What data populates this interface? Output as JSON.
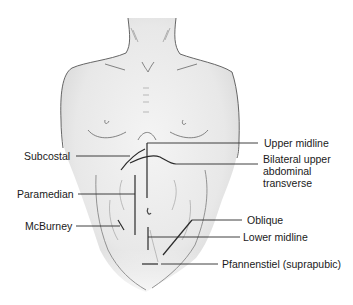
{
  "figure": {
    "labels": {
      "upper_midline": "Upper midline",
      "subcostal": "Subcostal",
      "bilateral_line1": "Bilateral upper",
      "bilateral_line2": "abdominal",
      "bilateral_line3": "transverse",
      "paramedian": "Paramedian",
      "mcburney": "McBurney",
      "oblique": "Oblique",
      "lower_midline": "Lower midline",
      "pfannenstiel": "Pfannenstiel (suprapubic)"
    },
    "colors": {
      "skin_shade": "#e6e6e6",
      "outline": "#555555",
      "incision": "#2a2a2a",
      "text": "#1a1a1a"
    }
  }
}
